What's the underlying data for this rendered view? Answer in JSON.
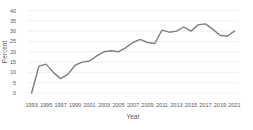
{
  "chart_data": {
    "type": "line",
    "title": "",
    "xlabel": "Year",
    "ylabel": "Percent",
    "x": [
      1993,
      1994,
      1995,
      1996,
      1997,
      1998,
      1999,
      2000,
      2001,
      2002,
      2003,
      2004,
      2005,
      2006,
      2007,
      2008,
      2009,
      2010,
      2011,
      2012,
      2013,
      2014,
      2015,
      2016,
      2017,
      2018,
      2019,
      2020,
      2021
    ],
    "values": [
      0,
      13,
      14,
      10,
      7,
      9,
      13.5,
      15,
      15.5,
      18,
      20,
      20.5,
      20,
      22,
      24.5,
      26,
      24.5,
      24,
      30.5,
      29.5,
      30,
      32,
      30,
      33,
      33.5,
      31,
      28,
      27.5,
      30
    ],
    "ylim": [
      0,
      40
    ],
    "ytick_step": 5,
    "ytick_labels": [
      "0",
      "5",
      "10",
      "15",
      "20",
      "25",
      "30",
      "35",
      "40"
    ],
    "xtick_labels": [
      "1993",
      "1995",
      "1997",
      "1999",
      "2001",
      "2003",
      "2005",
      "2007",
      "2009",
      "2011",
      "2013",
      "2015",
      "2017",
      "2019",
      "2021"
    ],
    "grid": "horizontal",
    "legend": "none",
    "colors": {
      "line": "#7f7f7f",
      "gridline": "#e9e9e9",
      "labels": "#595959",
      "background": "#ffffff"
    }
  }
}
